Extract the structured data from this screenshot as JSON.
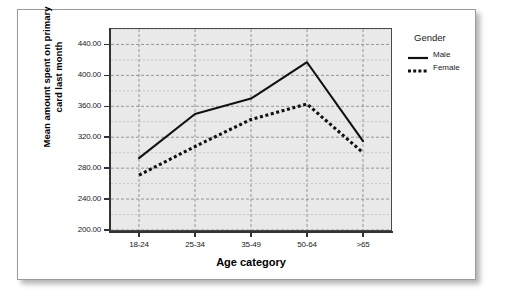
{
  "chart_data": {
    "type": "line",
    "title": "",
    "xlabel": "Age category",
    "ylabel": "Mean amount spent on primary card last month",
    "legend_title": "Gender",
    "legend_position": "right",
    "grid": true,
    "categories": [
      "18-24",
      "25-34",
      "35-49",
      "50-64",
      ">65"
    ],
    "ylim": [
      200,
      460
    ],
    "ytick_labels": [
      "200.00",
      "240.00",
      "280.00",
      "320.00",
      "360.00",
      "400.00",
      "440.00"
    ],
    "ytick_values": [
      200,
      240,
      280,
      320,
      360,
      400,
      440
    ],
    "series": [
      {
        "name": "Male",
        "style": "solid",
        "color": "#111111",
        "values": [
          293,
          350,
          370,
          417,
          315
        ]
      },
      {
        "name": "Female",
        "style": "dotted",
        "color": "#111111",
        "values": [
          271,
          308,
          343,
          363,
          300
        ]
      }
    ]
  },
  "axis": {
    "y_title": "Mean amount spent on primary card last month",
    "x_title": "Age category"
  },
  "legend": {
    "title": "Gender",
    "entries": [
      {
        "label": "Male",
        "style": "solid"
      },
      {
        "label": "Female",
        "style": "dotted"
      }
    ]
  }
}
